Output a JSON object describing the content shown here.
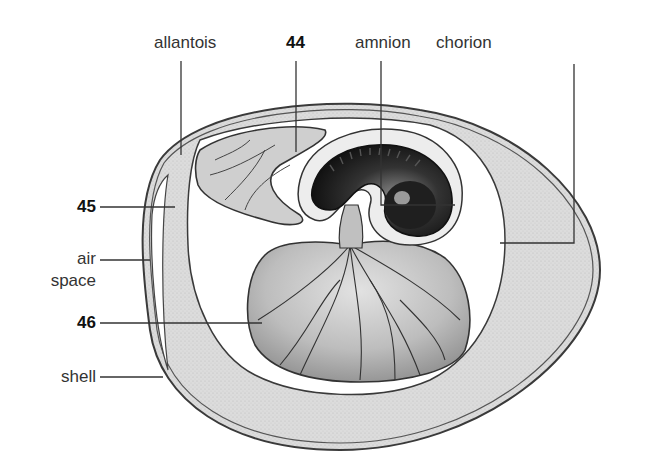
{
  "diagram": {
    "colors": {
      "background": "#ffffff",
      "albumen": "#d9d9d9",
      "line": "#3a3a3a",
      "yolk": "#a8a8a8",
      "embryo": "#2b2b2b"
    },
    "labels": {
      "allantois": "allantois",
      "num44": "44",
      "amnion": "amnion",
      "chorion": "chorion",
      "num45": "45",
      "air": "air",
      "space": "space",
      "num46": "46",
      "shell": "shell"
    }
  }
}
